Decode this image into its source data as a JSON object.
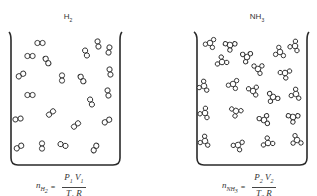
{
  "containers": [
    {
      "id": "h2",
      "gas_label": "H",
      "gas_sub": "2",
      "formula": {
        "lhs_n": "n",
        "lhs_sub": "H",
        "lhs_subsub": "2",
        "equals": "=",
        "num_P": "P",
        "num_P_sub": "1",
        "num_V": "V",
        "num_V_sub": "1",
        "den_T": "T",
        "den_T_sub": "1",
        "den_R": "R"
      },
      "molecule_type": "diatomic",
      "molecules": [
        [
          40,
          43,
          0
        ],
        [
          30,
          56,
          0
        ],
        [
          47,
          61,
          60
        ],
        [
          21,
          75,
          -30
        ],
        [
          62,
          78,
          90
        ],
        [
          82,
          79,
          60
        ],
        [
          30,
          95,
          0
        ],
        [
          51,
          113,
          -40
        ],
        [
          76,
          125,
          -40
        ],
        [
          86,
          53,
          70
        ],
        [
          98,
          44,
          80
        ],
        [
          109,
          50,
          100
        ],
        [
          110,
          72,
          80
        ],
        [
          108,
          93,
          80
        ],
        [
          91,
          102,
          70
        ],
        [
          107,
          121,
          -30
        ],
        [
          18,
          119,
          -10
        ],
        [
          19,
          147,
          -30
        ],
        [
          42,
          146,
          90
        ],
        [
          63,
          145,
          20
        ],
        [
          95,
          148,
          -60
        ]
      ]
    },
    {
      "id": "nh3",
      "gas_label": "NH",
      "gas_sub": "3",
      "formula": {
        "lhs_n": "n",
        "lhs_sub": "NH",
        "lhs_subsub": "3",
        "equals": "=",
        "num_P": "P",
        "num_P_sub": "2",
        "num_V": "V",
        "num_V_sub": "2",
        "den_T": "T",
        "den_T_sub": "2",
        "den_R": "R"
      },
      "molecule_type": "tetratomic",
      "molecules": [
        [
          210,
          43,
          0
        ],
        [
          230,
          45,
          30
        ],
        [
          222,
          62,
          200
        ],
        [
          247,
          57,
          150
        ],
        [
          258,
          69,
          260
        ],
        [
          280,
          52,
          90
        ],
        [
          295,
          46,
          110
        ],
        [
          285,
          73,
          20
        ],
        [
          204,
          86,
          100
        ],
        [
          233,
          84,
          0
        ],
        [
          253,
          91,
          250
        ],
        [
          273,
          97,
          60
        ],
        [
          296,
          94,
          100
        ],
        [
          205,
          113,
          110
        ],
        [
          236,
          111,
          40
        ],
        [
          264,
          120,
          240
        ],
        [
          293,
          117,
          30
        ],
        [
          205,
          141,
          100
        ],
        [
          238,
          145,
          10
        ],
        [
          268,
          143,
          200
        ],
        [
          297,
          140,
          80
        ]
      ]
    }
  ],
  "colors": {
    "stroke": "#2a2a2a",
    "text": "#333333",
    "background": "#ffffff"
  }
}
